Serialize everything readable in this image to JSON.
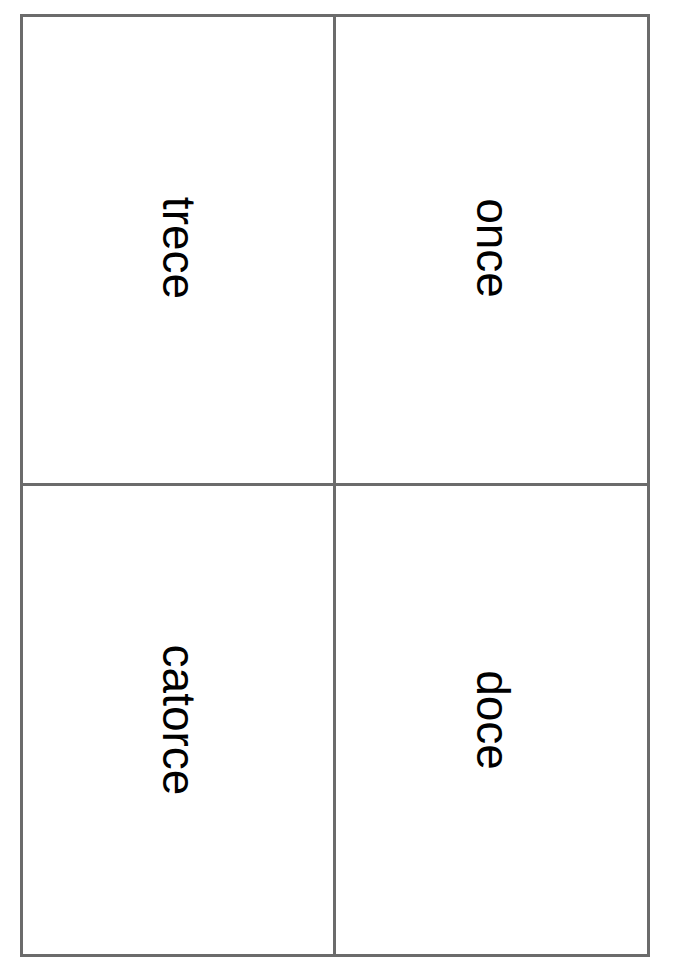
{
  "cards": [
    {
      "position": "top-left",
      "word": "trece"
    },
    {
      "position": "top-right",
      "word": "once"
    },
    {
      "position": "bottom-left",
      "word": "catorce"
    },
    {
      "position": "bottom-right",
      "word": "doce"
    }
  ],
  "colors": {
    "border": "#6b6b6b",
    "text": "#000000",
    "background": "#ffffff"
  }
}
